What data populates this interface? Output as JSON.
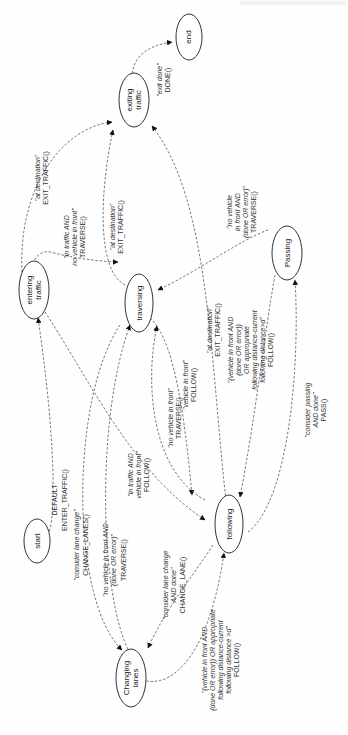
{
  "diagram": {
    "type": "state-machine",
    "orientation": "rotated-90-ccw",
    "header": {
      "text": ""
    },
    "nodes": [
      {
        "id": "start",
        "label": [
          "start"
        ]
      },
      {
        "id": "entering_traffic",
        "label": [
          "entering",
          "traffic"
        ]
      },
      {
        "id": "traversing",
        "label": [
          "traversing"
        ]
      },
      {
        "id": "exiting_traffic",
        "label": [
          "exiting",
          "traffic"
        ]
      },
      {
        "id": "end",
        "label": [
          "end"
        ]
      },
      {
        "id": "passing",
        "label": [
          "Passing"
        ]
      },
      {
        "id": "following",
        "label": [
          "following"
        ]
      },
      {
        "id": "changing_lanes",
        "label": [
          "Changing",
          "lanes"
        ]
      }
    ],
    "edges": [
      {
        "from": "start",
        "to": "entering_traffic",
        "condition": "DEFAULT",
        "action": "ENTER_TRAFFIC()"
      },
      {
        "from": "entering_traffic",
        "to": "traversing",
        "condition": [
          "\"in traffic AND",
          "no vehicle in front\""
        ],
        "action": "TRAVERSE()"
      },
      {
        "from": "entering_traffic",
        "to": "following",
        "condition": [
          "\"in traffic AND",
          "vehicle in front\""
        ],
        "action": "FOLLOW()"
      },
      {
        "from": "entering_traffic",
        "to": "exiting_traffic",
        "condition": "\"at destination\"",
        "action": "EXIT_TRAFFIC()"
      },
      {
        "from": "traversing",
        "to": "exiting_traffic",
        "condition": "\"at destination\"",
        "action": "EXIT_TRAFFIC()"
      },
      {
        "from": "exiting_traffic",
        "to": "end",
        "condition": "\"exit done\"",
        "action": "DONE()"
      },
      {
        "from": "traversing",
        "to": "following",
        "condition": "\"vehicle in front\"",
        "action": "FOLLOW()"
      },
      {
        "from": "following",
        "to": "traversing",
        "condition": "\"no vehicle in front\"",
        "action": "TRAVERSE()"
      },
      {
        "from": "following",
        "to": "exiting_traffic",
        "condition": "\"at destination\"",
        "action": "EXIT_TRAFFIC()"
      },
      {
        "from": "passing",
        "to": "traversing",
        "condition": [
          "\"no vehicle",
          "in front AND",
          "(done OR error)\""
        ],
        "action": "TRAVERSE()"
      },
      {
        "from": "passing",
        "to": "following",
        "condition": [
          "\"(vehicle in front AND",
          "(done OR error))",
          "OR appropriate",
          "following distance-current",
          "following distance>d\""
        ],
        "action": "FOLLOW()"
      },
      {
        "from": "following",
        "to": "passing",
        "condition": [
          "\"consider passing",
          "AND done\""
        ],
        "action": "PASS()"
      },
      {
        "from": "traversing",
        "to": "changing_lanes",
        "condition": "\"consider lane change\"",
        "action": "CHANGE_LANES()"
      },
      {
        "from": "changing_lanes",
        "to": "traversing",
        "condition": [
          "\"no vehicle in front AND",
          "(done OR error)\""
        ],
        "action": "TRAVERSE()"
      },
      {
        "from": "following",
        "to": "changing_lanes",
        "condition": [
          "\"consider lane change",
          "AND done\""
        ],
        "action": "CHANGE_LANE()"
      },
      {
        "from": "changing_lanes",
        "to": "following",
        "condition": [
          "\"(vehicle in front AND",
          "(done OR error)) OR appropriate",
          "following distance-current",
          "following distance >d\""
        ],
        "action": "FOLLOW()"
      }
    ]
  },
  "labels": {
    "start": "start",
    "entering_1": "entering",
    "entering_2": "traffic",
    "traversing": "traversing",
    "exiting_1": "exiting",
    "exiting_2": "traffic",
    "end": "end",
    "passing": "Passing",
    "following": "following",
    "changing_1": "Changing",
    "changing_2": "lanes",
    "e_start_enter_c": "DEFAULT",
    "e_start_enter_a": "ENTER_TRAFFIC()",
    "e_enter_trav_c1": "\"in traffic AND",
    "e_enter_trav_c2": "no vehicle in front\"",
    "e_enter_trav_a": "TRAVERSE()",
    "e_enter_follow_c1": "\"in traffic AND",
    "e_enter_follow_c2": "vehicle in front\"",
    "e_enter_follow_a": "FOLLOW()",
    "e_enter_exit_c": "\"at destination\"",
    "e_enter_exit_a": "EXIT_TRAFFIC()",
    "e_trav_exit_c": "\"at destination\"",
    "e_trav_exit_a": "EXIT_TRAFFIC()",
    "e_exit_end_c": "\"exit done\"",
    "e_exit_end_a": "DONE()",
    "e_trav_follow_c": "\"vehicle in front\"",
    "e_trav_follow_a": "FOLLOW()",
    "e_follow_trav_c": "\"no vehicle in front\"",
    "e_follow_trav_a": "TRAVERSE()",
    "e_follow_exit_c": "\"at destination\"",
    "e_follow_exit_a": "EXIT_TRAFFIC()",
    "e_pass_trav_c1": "\"no vehicle",
    "e_pass_trav_c2": "in front AND",
    "e_pass_trav_c3": "(done OR error)\"",
    "e_pass_trav_a": "TRAVERSE()",
    "e_pass_follow_c1": "\"(vehicle in front AND",
    "e_pass_follow_c2": "(done OR error))",
    "e_pass_follow_c3": "OR appropriate",
    "e_pass_follow_c4": "following distance-current",
    "e_pass_follow_c5": "following distance>d\"",
    "e_pass_follow_a": "FOLLOW()",
    "e_follow_pass_c1": "\"consider passing",
    "e_follow_pass_c2": "AND done\"",
    "e_follow_pass_a": "PASS()",
    "e_trav_change_c": "\"consider lane change\"",
    "e_trav_change_a": "CHANGE_LANES()",
    "e_change_trav_c1": "\"no vehicle in front AND",
    "e_change_trav_c2": "(done OR error)\"",
    "e_change_trav_a": "TRAVERSE()",
    "e_follow_change_c1": "\"consider lane change",
    "e_follow_change_c2": "AND done\"",
    "e_follow_change_a": "CHANGE_LANE()",
    "e_change_follow_c1": "\"(vehicle in front AND",
    "e_change_follow_c2": "(done OR error)) OR appropriate",
    "e_change_follow_c3": "following distance-current",
    "e_change_follow_c4": "following distance >d\"",
    "e_change_follow_a": "FOLLOW()"
  },
  "colors": {
    "background": "#fefefe",
    "node_stroke": "#333333",
    "edge_stroke": "#555555",
    "arrowhead": "#111111",
    "text": "#222222"
  }
}
